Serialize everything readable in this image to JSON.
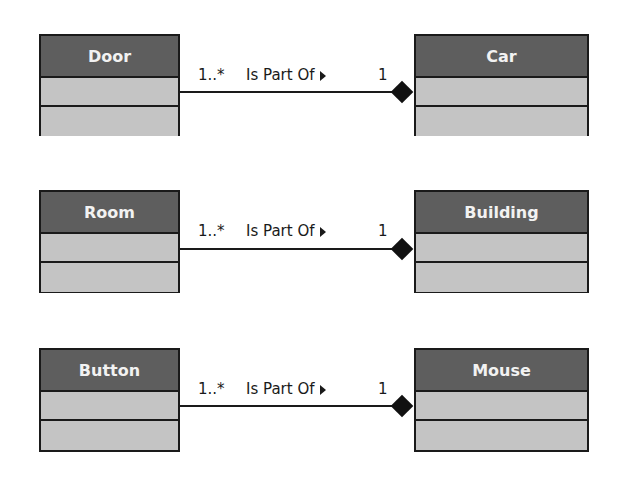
{
  "diagram": {
    "type": "UML class diagram - composition",
    "relations": [
      {
        "part": {
          "name": "Door"
        },
        "whole": {
          "name": "Car"
        },
        "part_multiplicity": "1..*",
        "label": "Is Part Of",
        "whole_multiplicity": "1",
        "direction_icon": "triangle-right-icon",
        "end_marker": "filled-diamond"
      },
      {
        "part": {
          "name": "Room"
        },
        "whole": {
          "name": "Building"
        },
        "part_multiplicity": "1..*",
        "label": "Is Part Of",
        "whole_multiplicity": "1",
        "direction_icon": "triangle-right-icon",
        "end_marker": "filled-diamond"
      },
      {
        "part": {
          "name": "Button"
        },
        "whole": {
          "name": "Mouse"
        },
        "part_multiplicity": "1..*",
        "label": "Is Part Of",
        "whole_multiplicity": "1",
        "direction_icon": "triangle-right-icon",
        "end_marker": "filled-diamond"
      }
    ],
    "colors": {
      "header": "#5e5e5e",
      "compartment": "#c4c4c4",
      "border": "#1a1a1a",
      "header_text": "#f2f2f2"
    }
  }
}
